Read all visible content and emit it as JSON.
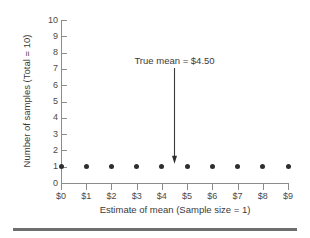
{
  "chart_data": {
    "type": "scatter",
    "title": "",
    "xlabel": "Estimate of mean (Sample size = 1)",
    "ylabel": "Number of samples (Total = 10)",
    "x": [
      0,
      1,
      2,
      3,
      4,
      5,
      6,
      7,
      8,
      9
    ],
    "values": [
      1,
      1,
      1,
      1,
      1,
      1,
      1,
      1,
      1,
      1
    ],
    "xtick_labels": [
      "$0",
      "$1",
      "$2",
      "$3",
      "$4",
      "$5",
      "$6",
      "$7",
      "$8",
      "$9"
    ],
    "ytick_labels": [
      "10",
      "9",
      "8",
      "7",
      "6",
      "5",
      "4",
      "3",
      "2",
      "1",
      "0"
    ],
    "ytick_values": [
      10,
      9,
      8,
      7,
      6,
      5,
      4,
      3,
      2,
      1,
      0
    ],
    "xlim": [
      0,
      9
    ],
    "ylim": [
      0,
      10
    ],
    "grid": false,
    "legend": "none",
    "annotations": [
      {
        "text": "True mean = $4.50",
        "x": 4.5,
        "y": 1,
        "arrow": "down"
      }
    ],
    "marker_color": "#2e2e2e",
    "axis_color": "#8c8c8c",
    "rule_color": "#6e6e6e"
  }
}
